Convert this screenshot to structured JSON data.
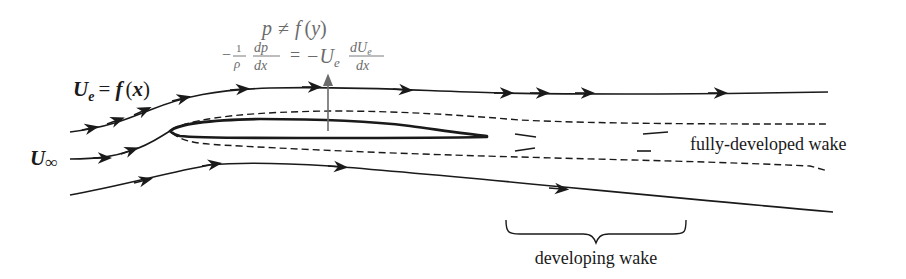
{
  "diagram": {
    "labels": {
      "edge_velocity": {
        "U": "U",
        "sub": "e",
        "eq": "= ",
        "f": "f",
        "arg": "(x)"
      },
      "freestream": {
        "U": "U",
        "sub": "∞"
      },
      "pressure_condition": {
        "p": "p",
        "neq": "≠",
        "f": "f",
        "arg": "(y)"
      },
      "momentum_eq": {
        "minus1": "−",
        "one": "1",
        "rho": "ρ",
        "dp": "dp",
        "dx1": "dx",
        "equals": "=",
        "minus2": "−U",
        "sub": "e",
        "dUe": "dU",
        "dUe_sub": "e",
        "dx2": "dx"
      },
      "fully_developed_wake": "fully-developed wake",
      "developing_wake": "developing wake"
    },
    "colors": {
      "stroke": "#1a1a1a",
      "equation": "#6b6b6b",
      "arrow": "#6b6b6b",
      "background": "#ffffff"
    }
  }
}
